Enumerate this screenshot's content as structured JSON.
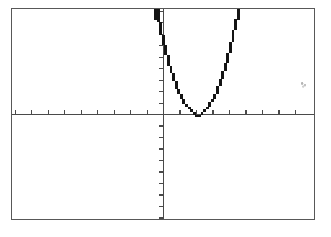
{
  "screen": {
    "device": "graphing-calculator-screen",
    "frame_color": "#585858",
    "background_color": "#ffffff",
    "ink_color": "#1a1a1a",
    "width_px": 304,
    "height_px": 212
  },
  "chart_data": {
    "type": "line",
    "title": "",
    "subtitle": "",
    "xlabel": "",
    "ylabel": "",
    "grid": false,
    "legend_position": "none",
    "axes": {
      "x_axis_visible": true,
      "y_axis_visible": true,
      "x_axis_screen_y_px": 106,
      "y_axis_screen_x_px": 152,
      "tick_marks": true,
      "tick_labels": false,
      "x_tick_spacing_px": 16.6,
      "y_tick_spacing_px": 11.6,
      "x_tick_count_left": 9,
      "x_tick_count_right": 9,
      "y_tick_count_above": 9,
      "y_tick_count_below": 9,
      "xlim": [
        -9.2,
        9.2
      ],
      "ylim": [
        -9.2,
        9.2
      ]
    },
    "series": [
      {
        "name": "parabola",
        "equation": "y = a(x - h)^2 + k",
        "vertex": [
          2.1,
          0
        ],
        "opens": "up",
        "tangent_to_x_axis": true,
        "x": [
          -0.35,
          0.0,
          0.3,
          0.6,
          0.9,
          1.2,
          1.5,
          1.8,
          2.1,
          2.4,
          2.7,
          3.0,
          3.3,
          3.6,
          3.9,
          4.2,
          4.5,
          4.8,
          5.1
        ],
        "y": [
          8.9,
          7.5,
          5.8,
          4.2,
          2.9,
          1.7,
          0.8,
          0.2,
          0.0,
          0.2,
          0.8,
          1.7,
          2.9,
          4.2,
          5.8,
          7.5,
          9.5,
          11.0,
          12.0
        ],
        "color": "#1a1a1a",
        "render_style": "pixelated-stairstep"
      }
    ],
    "annotations": []
  },
  "artifacts": {
    "speckle_present": true,
    "speckle_position_px": [
      288,
      72
    ]
  }
}
